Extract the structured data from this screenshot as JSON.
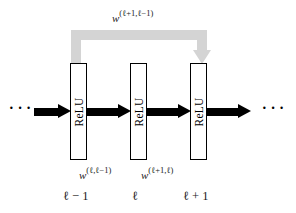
{
  "figure": {
    "type": "neural-network-layer-diagram",
    "background_color": "#ffffff",
    "arrow_color": "#000000",
    "skip_arrow_color": "#d4d4d4",
    "box_border_color": "#000000",
    "text_color": "#1a1a1a"
  },
  "layers": [
    {
      "activation_label": "ReLU",
      "index_label": "ℓ − 1"
    },
    {
      "activation_label": "ReLU",
      "index_label": "ℓ"
    },
    {
      "activation_label": "ReLU",
      "index_label": "ℓ + 1"
    }
  ],
  "weights": {
    "skip": {
      "base": "w",
      "superscript": "(ℓ+1,ℓ−1)"
    },
    "l_from_lminus1": {
      "base": "w",
      "superscript": "(ℓ,ℓ−1)"
    },
    "lplus1_from_l": {
      "base": "w",
      "superscript": "(ℓ+1,ℓ)"
    }
  },
  "continuation": {
    "left_ellipsis": "···",
    "right_ellipsis": "···"
  }
}
